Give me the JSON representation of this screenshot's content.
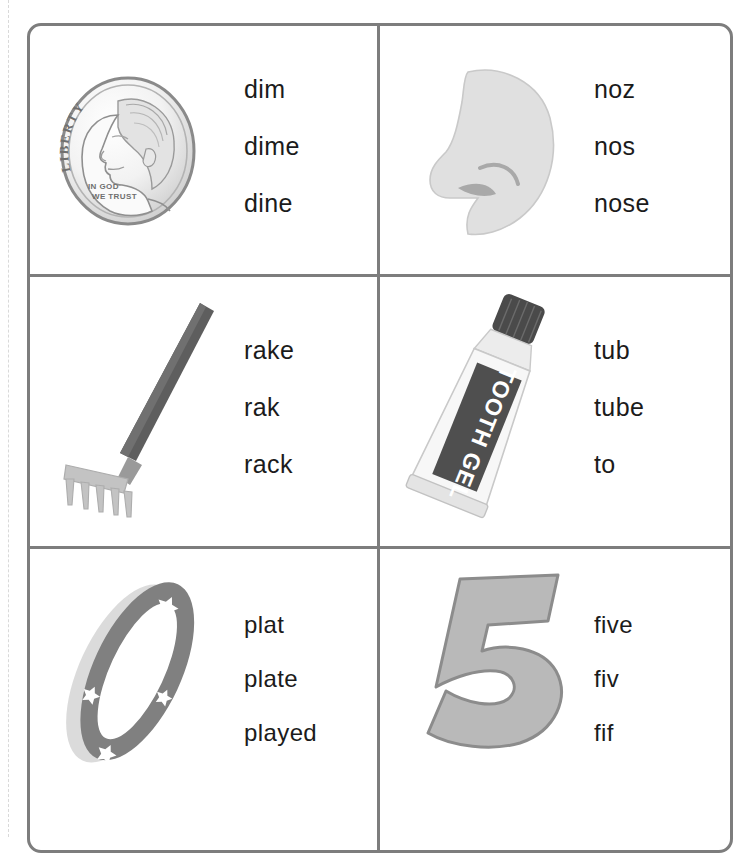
{
  "worksheet": {
    "title": "Word choice picture worksheet",
    "border_color": "#7d7d7d",
    "cells": [
      {
        "id": "cell-dime",
        "picture_name": "dime-coin-illustration",
        "picture_label": "dime",
        "coin_text": {
          "liberty": "LIBERTY",
          "motto_line1": "IN GOD",
          "motto_line2": "WE TRUST"
        },
        "options": [
          "dim",
          "dime",
          "dine"
        ]
      },
      {
        "id": "cell-nose",
        "picture_name": "nose-profile-illustration",
        "picture_label": "nose",
        "options": [
          "noz",
          "nos",
          "nose"
        ]
      },
      {
        "id": "cell-rake",
        "picture_name": "rake-illustration",
        "picture_label": "rake",
        "options": [
          "rake",
          "rak",
          "rack"
        ]
      },
      {
        "id": "cell-tube",
        "picture_name": "toothpaste-tube-illustration",
        "picture_label": "tube",
        "tube_label": "TOOTH GEL",
        "options": [
          "tub",
          "tube",
          "to"
        ]
      },
      {
        "id": "cell-plate",
        "picture_name": "plate-illustration",
        "picture_label": "plate",
        "options": [
          "plat",
          "plate",
          "played"
        ]
      },
      {
        "id": "cell-five",
        "picture_name": "number-five-illustration",
        "picture_label": "five",
        "numeral": "5",
        "options": [
          "five",
          "fiv",
          "fif"
        ]
      }
    ]
  },
  "colors": {
    "border": "#7d7d7d",
    "text": "#1b1b1b",
    "art_gray": "#808080",
    "art_light_gray": "#d6d6d6",
    "art_dark_gray": "#4f4f4f"
  }
}
